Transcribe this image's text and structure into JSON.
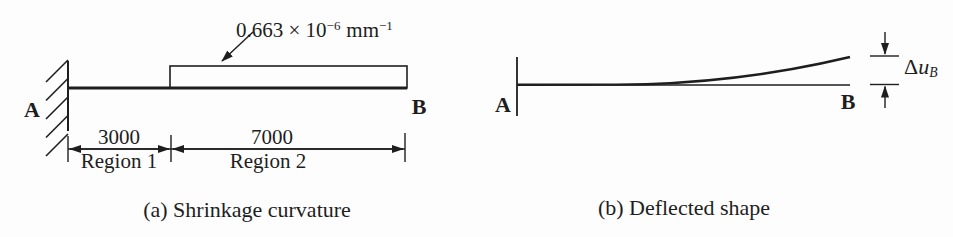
{
  "colors": {
    "ink": "#1e1e1e",
    "background": "#fdfdfd"
  },
  "figure_a": {
    "caption": "(a) Shrinkage curvature",
    "label_a": "A",
    "label_b": "B",
    "curvature": {
      "coefficient": "0.663 × 10",
      "exponent": "−6",
      "unit": "mm",
      "unit_exponent": "−1"
    },
    "dimensions": [
      {
        "length": "3000",
        "region": "Region 1"
      },
      {
        "length": "7000",
        "region": "Region 2"
      }
    ]
  },
  "figure_b": {
    "caption": "(b) Deflected shape",
    "label_a": "A",
    "label_b": "B",
    "deflection": {
      "delta": "Δ",
      "var": "u",
      "subscript": "B"
    }
  }
}
